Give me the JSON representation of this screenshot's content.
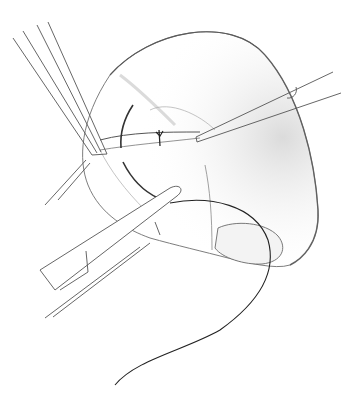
{
  "illustration": {
    "subject": "surgical suture illustration",
    "style": "pencil drawing, grayscale",
    "background": "#ffffff",
    "ink": "#333333",
    "shade": "#9a9a9a",
    "elements": [
      "organ-tissue",
      "retractor-sutures-upper-left",
      "needle-holder-upper-right",
      "forceps-lower-left",
      "suture-thread",
      "knot"
    ]
  }
}
